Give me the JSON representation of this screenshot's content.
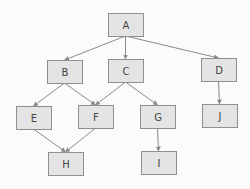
{
  "diagram": {
    "type": "tree-graph",
    "nodes": [
      {
        "id": "A",
        "label": "A",
        "x": 108,
        "y": 13,
        "w": 35,
        "h": 23
      },
      {
        "id": "B",
        "label": "B",
        "x": 47,
        "y": 60,
        "w": 35,
        "h": 23
      },
      {
        "id": "C",
        "label": "C",
        "x": 108,
        "y": 59,
        "w": 35,
        "h": 23
      },
      {
        "id": "D",
        "label": "D",
        "x": 201,
        "y": 58,
        "w": 35,
        "h": 23
      },
      {
        "id": "E",
        "label": "E",
        "x": 16,
        "y": 106,
        "w": 35,
        "h": 23
      },
      {
        "id": "F",
        "label": "F",
        "x": 78,
        "y": 105,
        "w": 35,
        "h": 23
      },
      {
        "id": "G",
        "label": "G",
        "x": 140,
        "y": 105,
        "w": 35,
        "h": 23
      },
      {
        "id": "J",
        "label": "J",
        "x": 202,
        "y": 104,
        "w": 35,
        "h": 23
      },
      {
        "id": "H",
        "label": "H",
        "x": 48,
        "y": 152,
        "w": 35,
        "h": 23
      },
      {
        "id": "I",
        "label": "I",
        "x": 141,
        "y": 151,
        "w": 35,
        "h": 23
      }
    ],
    "edges": [
      {
        "from": "A",
        "to": "B"
      },
      {
        "from": "A",
        "to": "C"
      },
      {
        "from": "A",
        "to": "D"
      },
      {
        "from": "B",
        "to": "E"
      },
      {
        "from": "B",
        "to": "F"
      },
      {
        "from": "C",
        "to": "F"
      },
      {
        "from": "C",
        "to": "G"
      },
      {
        "from": "D",
        "to": "J"
      },
      {
        "from": "E",
        "to": "H"
      },
      {
        "from": "F",
        "to": "H"
      },
      {
        "from": "G",
        "to": "I"
      }
    ],
    "colors": {
      "node_fill": "#e4e4e4",
      "node_stroke": "#8f8f8f",
      "edge": "#8a8a8a",
      "text": "#444444",
      "background": "#fbfbfb"
    }
  }
}
